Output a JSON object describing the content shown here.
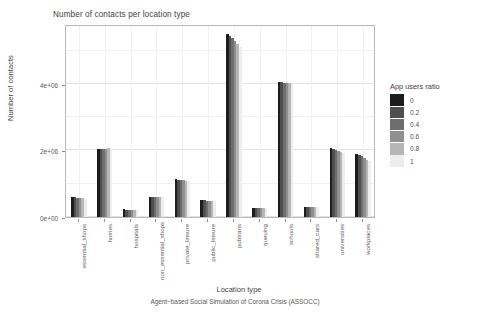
{
  "chart_data": {
    "type": "bar",
    "title": "Number of contacts per location type",
    "xlabel": "Location type",
    "ylabel": "Number of contacts",
    "caption": "Agent−based Social Simulation of Corona Crisis (ASSOCC)",
    "grid": true,
    "legend_position": "right",
    "legend_title": "App users ratio",
    "ylim": [
      0,
      5800000
    ],
    "ytick_values": [
      0,
      2000000,
      4000000
    ],
    "ytick_labels": [
      "0e+00",
      "2e+06",
      "4e+06"
    ],
    "categories": [
      "essential_shops",
      "homes",
      "hospitals",
      "non_essential_shops",
      "private_leisure",
      "public_leisure",
      "pubtrans",
      "queuing",
      "schools",
      "shared_cars",
      "universities",
      "workplaces"
    ],
    "series": [
      {
        "name": "0",
        "color": "#1c1c1c",
        "values": [
          600000,
          2040000,
          235000,
          610000,
          1130000,
          510000,
          5500000,
          265000,
          4060000,
          295000,
          2060000,
          1900000
        ]
      },
      {
        "name": "0.2",
        "color": "#4f4f4f",
        "values": [
          590000,
          2040000,
          225000,
          605000,
          1120000,
          500000,
          5440000,
          262000,
          4050000,
          293000,
          2040000,
          1860000
        ]
      },
      {
        "name": "0.4",
        "color": "#6e6e6e",
        "values": [
          580000,
          2050000,
          220000,
          605000,
          1110000,
          495000,
          5370000,
          260000,
          4040000,
          292000,
          2010000,
          1820000
        ]
      },
      {
        "name": "0.6",
        "color": "#8f8f8f",
        "values": [
          570000,
          2055000,
          215000,
          600000,
          1100000,
          490000,
          5290000,
          258000,
          4030000,
          290000,
          1980000,
          1770000
        ]
      },
      {
        "name": "0.8",
        "color": "#b6b6b6",
        "values": [
          560000,
          2060000,
          212000,
          600000,
          1090000,
          485000,
          5200000,
          256000,
          4020000,
          288000,
          1950000,
          1720000
        ]
      },
      {
        "name": "1",
        "color": "#ededed",
        "values": [
          555000,
          2070000,
          210000,
          600000,
          1080000,
          480000,
          5120000,
          255000,
          4010000,
          287000,
          1930000,
          1680000
        ]
      }
    ]
  },
  "legend": {
    "title": "App users ratio",
    "entries": [
      {
        "label": "0",
        "color": "#1c1c1c"
      },
      {
        "label": "0.2",
        "color": "#4f4f4f"
      },
      {
        "label": "0.4",
        "color": "#6e6e6e"
      },
      {
        "label": "0.6",
        "color": "#8f8f8f"
      },
      {
        "label": "0.8",
        "color": "#b6b6b6"
      },
      {
        "label": "1",
        "color": "#ededed"
      }
    ]
  }
}
